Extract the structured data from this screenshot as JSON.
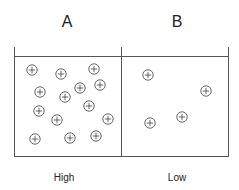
{
  "compartments": [
    {
      "id": "A",
      "title": "A",
      "concentration_label": "High",
      "particles": [
        [
          32,
          70
        ],
        [
          61,
          74
        ],
        [
          94,
          69
        ],
        [
          40,
          92
        ],
        [
          65,
          97
        ],
        [
          80,
          88
        ],
        [
          100,
          85
        ],
        [
          39,
          111
        ],
        [
          57,
          120
        ],
        [
          89,
          106
        ],
        [
          108,
          119
        ],
        [
          35,
          139
        ],
        [
          70,
          138
        ],
        [
          96,
          136
        ]
      ]
    },
    {
      "id": "B",
      "title": "B",
      "concentration_label": "Low",
      "particles": [
        [
          148,
          75
        ],
        [
          206,
          91
        ],
        [
          150,
          123
        ],
        [
          182,
          117
        ]
      ]
    }
  ],
  "particle_icon": "circled-plus-ion",
  "colors": {
    "stroke": "#555555",
    "text": "#222222"
  }
}
